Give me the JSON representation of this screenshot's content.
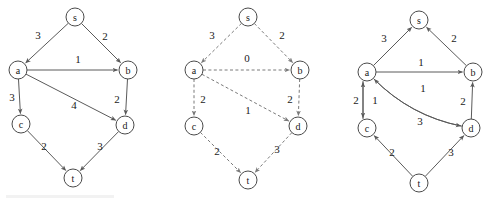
{
  "figure": {
    "background_color": "#ffffff",
    "node_stroke_color": "#4a4a4a",
    "edge_color": "#5a5a5a",
    "dashed_edge_color": "#7a7a7a",
    "node_radius": 9
  },
  "graphs": [
    {
      "id": "graph-original",
      "style": "solid",
      "nodes": [
        {
          "id": "s",
          "label": "s",
          "x": 75,
          "y": 17
        },
        {
          "id": "a",
          "label": "a",
          "x": 18,
          "y": 70
        },
        {
          "id": "b",
          "label": "b",
          "x": 128,
          "y": 70
        },
        {
          "id": "c",
          "label": "c",
          "x": 21,
          "y": 124
        },
        {
          "id": "d",
          "label": "d",
          "x": 125,
          "y": 125
        },
        {
          "id": "t",
          "label": "t",
          "x": 73,
          "y": 178
        }
      ],
      "edges": [
        {
          "from": "s",
          "to": "a",
          "weight": "3",
          "label_x": 38,
          "label_y": 35,
          "curve": 0
        },
        {
          "from": "s",
          "to": "b",
          "weight": "2",
          "label_x": 105,
          "label_y": 36,
          "curve": 0
        },
        {
          "from": "a",
          "to": "b",
          "weight": "1",
          "label_x": 78,
          "label_y": 59,
          "curve": 0
        },
        {
          "from": "a",
          "to": "c",
          "weight": "3",
          "label_x": 12,
          "label_y": 97,
          "curve": 0
        },
        {
          "from": "a",
          "to": "d",
          "weight": "4",
          "label_x": 74,
          "label_y": 105,
          "curve": 0
        },
        {
          "from": "b",
          "to": "d",
          "weight": "2",
          "label_x": 117,
          "label_y": 99,
          "curve": 0
        },
        {
          "from": "c",
          "to": "t",
          "weight": "2",
          "label_x": 44,
          "label_y": 146,
          "curve": 0
        },
        {
          "from": "d",
          "to": "t",
          "weight": "3",
          "label_x": 100,
          "label_y": 146,
          "curve": 0
        }
      ]
    },
    {
      "id": "graph-dashed",
      "style": "dashed",
      "nodes": [
        {
          "id": "s",
          "label": "s",
          "x": 248,
          "y": 17
        },
        {
          "id": "a",
          "label": "a",
          "x": 194,
          "y": 70
        },
        {
          "id": "b",
          "label": "b",
          "x": 300,
          "y": 70
        },
        {
          "id": "c",
          "label": "c",
          "x": 194,
          "y": 126
        },
        {
          "id": "d",
          "label": "d",
          "x": 298,
          "y": 126
        },
        {
          "id": "t",
          "label": "t",
          "x": 248,
          "y": 180
        }
      ],
      "edges": [
        {
          "from": "s",
          "to": "a",
          "weight": "3",
          "label_x": 212,
          "label_y": 35,
          "curve": 0
        },
        {
          "from": "s",
          "to": "b",
          "weight": "2",
          "label_x": 282,
          "label_y": 35,
          "curve": 0
        },
        {
          "from": "a",
          "to": "b",
          "weight": "0",
          "label_x": 247,
          "label_y": 58,
          "curve": 0
        },
        {
          "from": "a",
          "to": "c",
          "weight": "2",
          "label_x": 203,
          "label_y": 99,
          "curve": 0
        },
        {
          "from": "a",
          "to": "d",
          "weight": "1",
          "label_x": 248,
          "label_y": 110,
          "curve": 0
        },
        {
          "from": "b",
          "to": "d",
          "weight": "2",
          "label_x": 290,
          "label_y": 99,
          "curve": 0
        },
        {
          "from": "c",
          "to": "t",
          "weight": "2",
          "label_x": 217,
          "label_y": 151,
          "curve": 0
        },
        {
          "from": "d",
          "to": "t",
          "weight": "3",
          "label_x": 277,
          "label_y": 149,
          "curve": 0
        }
      ]
    },
    {
      "id": "graph-residual",
      "style": "solid",
      "nodes": [
        {
          "id": "s",
          "label": "s",
          "x": 419,
          "y": 20
        },
        {
          "id": "a",
          "label": "a",
          "x": 367,
          "y": 72
        },
        {
          "id": "b",
          "label": "b",
          "x": 473,
          "y": 72
        },
        {
          "id": "c",
          "label": "c",
          "x": 367,
          "y": 128
        },
        {
          "id": "d",
          "label": "d",
          "x": 471,
          "y": 128
        },
        {
          "id": "t",
          "label": "t",
          "x": 419,
          "y": 183
        }
      ],
      "edges": [
        {
          "from": "a",
          "to": "s",
          "weight": "3",
          "label_x": 384,
          "label_y": 38,
          "curve": 0
        },
        {
          "from": "b",
          "to": "s",
          "weight": "2",
          "label_x": 454,
          "label_y": 38,
          "curve": 0
        },
        {
          "from": "a",
          "to": "b",
          "weight": "1",
          "label_x": 421,
          "label_y": 62,
          "curve": 0
        },
        {
          "from": "c",
          "to": "a",
          "weight": "2",
          "label_x": 356,
          "label_y": 100,
          "curve": 0,
          "offset": -4
        },
        {
          "from": "a",
          "to": "c",
          "weight": "1",
          "label_x": 375,
          "label_y": 100,
          "curve": 0,
          "offset": 4
        },
        {
          "from": "d",
          "to": "a",
          "weight": "1",
          "label_x": 423,
          "label_y": 88,
          "curve": -9
        },
        {
          "from": "a",
          "to": "d",
          "weight": "3",
          "label_x": 420,
          "label_y": 121,
          "curve": 9
        },
        {
          "from": "d",
          "to": "b",
          "weight": "2",
          "label_x": 463,
          "label_y": 101,
          "curve": 0
        },
        {
          "from": "t",
          "to": "c",
          "weight": "2",
          "label_x": 392,
          "label_y": 152,
          "curve": 0
        },
        {
          "from": "t",
          "to": "d",
          "weight": "3",
          "label_x": 451,
          "label_y": 152,
          "curve": 0
        }
      ]
    }
  ]
}
